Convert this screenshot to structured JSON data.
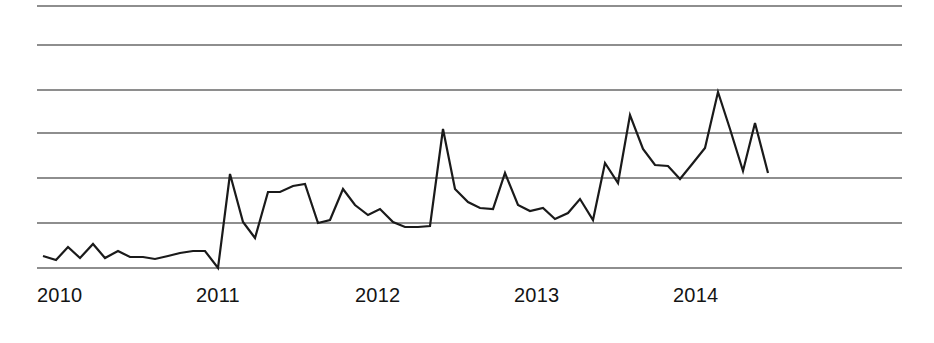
{
  "chart_data": {
    "type": "line",
    "title": "",
    "subtitle": "",
    "xlabel": "",
    "ylabel": "",
    "grid": true,
    "legend": false,
    "legend_position": "none",
    "axis_line": false,
    "y_axis_visible": false,
    "y_tick_labels": [],
    "gridline_count": 7,
    "gridline_y_pixels": [
      6,
      45,
      90,
      133,
      178,
      223,
      268
    ],
    "xlim": [
      "2010-01",
      "2014-11"
    ],
    "ylim": [
      0,
      6
    ],
    "x_tick_labels": [
      "2010",
      "2011",
      "2012",
      "2013",
      "2014"
    ],
    "x_tick_pixels": [
      37,
      196,
      355,
      514,
      673
    ],
    "series": [
      {
        "name": "series-1",
        "color": "#1a1a1a",
        "x": [
          "2010-01",
          "2010-02",
          "2010-03",
          "2010-04",
          "2010-05",
          "2010-06",
          "2010-07",
          "2010-08",
          "2010-09",
          "2010-10",
          "2010-11",
          "2010-12",
          "2011-01",
          "2011-02",
          "2011-03",
          "2011-04",
          "2011-05",
          "2011-06",
          "2011-07",
          "2011-08",
          "2011-09",
          "2011-10",
          "2011-11",
          "2011-12",
          "2012-01",
          "2012-02",
          "2012-03",
          "2012-04",
          "2012-05",
          "2012-06",
          "2012-07",
          "2012-08",
          "2012-09",
          "2012-10",
          "2012-11",
          "2012-12",
          "2013-01",
          "2013-02",
          "2013-03",
          "2013-04",
          "2013-05",
          "2013-06",
          "2013-07",
          "2013-08",
          "2013-09",
          "2013-10",
          "2013-11",
          "2013-12",
          "2014-01",
          "2014-02",
          "2014-03",
          "2014-04",
          "2014-05",
          "2014-06",
          "2014-07",
          "2014-08",
          "2014-09",
          "2014-10",
          "2014-11"
        ],
        "values": [
          1.0,
          0.84,
          1.36,
          0.92,
          1.48,
          0.92,
          1.2,
          0.96,
          0.96,
          0.88,
          1.0,
          1.12,
          1.2,
          1.2,
          0.52,
          4.28,
          1.92,
          1.28,
          3.12,
          3.12,
          3.36,
          3.44,
          1.88,
          2.0,
          3.24,
          2.6,
          2.2,
          2.44,
          1.92,
          1.72,
          1.72,
          1.76,
          5.72,
          3.32,
          2.8,
          2.56,
          2.52,
          3.96,
          2.72,
          2.48,
          2.6,
          2.16,
          2.44,
          3.0,
          2.12,
          4.4,
          3.6,
          6.32,
          4.96,
          4.32,
          4.28,
          3.8,
          4.4,
          5.0,
          7.24,
          5.72,
          4.04,
          6.0,
          3.96
        ],
        "pixel_points": [
          [
            43,
            256
          ],
          [
            56,
            260
          ],
          [
            68,
            247
          ],
          [
            80,
            258
          ],
          [
            93,
            244
          ],
          [
            105,
            258
          ],
          [
            118,
            251
          ],
          [
            130,
            257
          ],
          [
            143,
            257
          ],
          [
            155,
            259
          ],
          [
            168,
            256
          ],
          [
            180,
            253
          ],
          [
            193,
            251
          ],
          [
            205,
            251
          ],
          [
            218,
            268
          ],
          [
            230,
            174
          ],
          [
            243,
            222
          ],
          [
            255,
            238
          ],
          [
            268,
            192
          ],
          [
            280,
            192
          ],
          [
            293,
            186
          ],
          [
            305,
            184
          ],
          [
            318,
            223
          ],
          [
            330,
            220
          ],
          [
            343,
            189
          ],
          [
            355,
            205
          ],
          [
            368,
            215
          ],
          [
            380,
            209
          ],
          [
            393,
            222
          ],
          [
            405,
            227
          ],
          [
            418,
            227
          ],
          [
            430,
            226
          ],
          [
            443,
            129
          ],
          [
            455,
            189
          ],
          [
            468,
            202
          ],
          [
            480,
            208
          ],
          [
            493,
            209
          ],
          [
            505,
            173
          ],
          [
            518,
            205
          ],
          [
            530,
            211
          ],
          [
            543,
            208
          ],
          [
            555,
            219
          ],
          [
            568,
            213
          ],
          [
            580,
            199
          ],
          [
            593,
            220
          ],
          [
            605,
            163
          ],
          [
            618,
            183
          ],
          [
            630,
            115
          ],
          [
            643,
            149
          ],
          [
            655,
            165
          ],
          [
            668,
            166
          ],
          [
            680,
            179
          ],
          [
            693,
            163
          ],
          [
            705,
            148
          ],
          [
            718,
            92
          ],
          [
            730,
            129
          ],
          [
            743,
            171
          ],
          [
            755,
            123
          ],
          [
            768,
            173
          ]
        ]
      }
    ]
  },
  "axis": {
    "x_labels": [
      {
        "text": "2010",
        "left_px": 37
      },
      {
        "text": "2011",
        "left_px": 196
      },
      {
        "text": "2012",
        "left_px": 355
      },
      {
        "text": "2013",
        "left_px": 514
      },
      {
        "text": "2014",
        "left_px": 673
      }
    ]
  },
  "style": {
    "background": "#ffffff",
    "line_color": "#1a1a1a",
    "grid_color": "#8e8e8e",
    "label_color": "#141414"
  }
}
